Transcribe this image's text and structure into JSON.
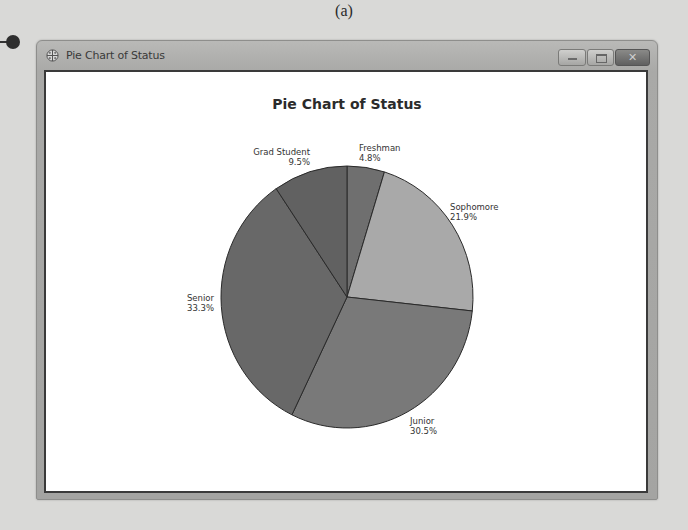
{
  "figure": {
    "label": "(a)"
  },
  "window": {
    "title": "Pie Chart of Status",
    "icon": "globe-icon",
    "buttons": {
      "minimize": "minimize-icon",
      "maximize": "maximize-icon",
      "close_glyph": "✕"
    }
  },
  "chart": {
    "title": "Pie Chart of Status"
  },
  "labels": {
    "freshman": {
      "name": "Freshman",
      "pct": "4.8%"
    },
    "sophomore": {
      "name": "Sophomore",
      "pct": "21.9%"
    },
    "junior": {
      "name": "Junior",
      "pct": "30.5%"
    },
    "senior": {
      "name": "Senior",
      "pct": "33.3%"
    },
    "grad": {
      "name": "Grad Student",
      "pct": "9.5%"
    }
  },
  "chart_data": {
    "type": "pie",
    "title": "Pie Chart of Status",
    "categories": [
      "Freshman",
      "Sophomore",
      "Junior",
      "Senior",
      "Grad Student"
    ],
    "values": [
      4.8,
      21.9,
      30.5,
      33.3,
      9.5
    ],
    "unit": "%",
    "start_angle_deg": 90,
    "direction": "clockwise",
    "colors": [
      "#6f6f6f",
      "#a9a9a9",
      "#797979",
      "#686868",
      "#616161"
    ],
    "legend": "none",
    "labels_on_slices": true
  }
}
